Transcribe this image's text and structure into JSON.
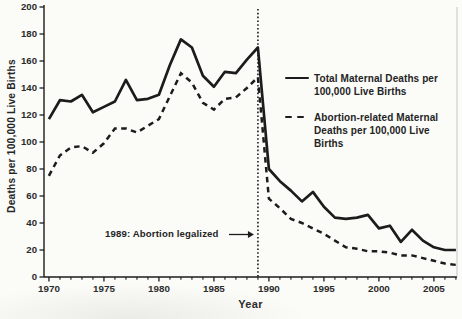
{
  "page": {
    "background": "#fbfbf8",
    "ink_color": "#1c1c1c"
  },
  "chart_data": {
    "type": "line",
    "title": "",
    "xlabel": "Year",
    "ylabel": "Deaths per 100,000 Live Births",
    "xlim": [
      1969.55,
      2007.1
    ],
    "ylim": [
      0,
      200
    ],
    "grid": false,
    "legend_position": "inside-upper-right",
    "y_ticks": [
      0,
      20,
      40,
      60,
      80,
      100,
      120,
      140,
      160,
      180,
      200
    ],
    "x_major_ticks": [
      1970,
      1975,
      1980,
      1985,
      1990,
      1995,
      2000,
      2005
    ],
    "x_minor_tick_every": 1,
    "x": [
      1970,
      1971,
      1972,
      1973,
      1974,
      1975,
      1976,
      1977,
      1978,
      1979,
      1980,
      1981,
      1982,
      1983,
      1984,
      1985,
      1986,
      1987,
      1988,
      1989,
      1990,
      1991,
      1992,
      1993,
      1994,
      1995,
      1996,
      1997,
      1998,
      1999,
      2000,
      2001,
      2002,
      2003,
      2004,
      2005,
      2006,
      2007
    ],
    "series": [
      {
        "name": "Total Maternal Deaths per 100,000 Live Births",
        "style": "solid",
        "values": [
          117,
          131,
          130,
          135,
          122,
          126,
          130,
          146,
          131,
          132,
          135,
          157,
          176,
          170,
          149,
          141,
          152,
          151,
          161,
          170,
          80,
          71,
          64,
          56,
          63,
          52,
          44,
          43,
          44,
          46,
          36,
          38,
          26,
          35,
          27,
          22,
          20,
          20
        ]
      },
      {
        "name": "Abortion-related Maternal Deaths per 100,000 Live Births",
        "style": "dashed",
        "values": [
          75,
          90,
          96,
          97,
          92,
          99,
          110,
          110,
          107,
          112,
          117,
          134,
          151,
          144,
          129,
          124,
          132,
          133,
          140,
          148,
          58,
          51,
          43,
          40,
          36,
          32,
          27,
          22,
          21,
          19,
          19,
          18,
          16,
          16,
          14,
          12,
          10,
          9
        ]
      }
    ],
    "vline": {
      "year": 1989,
      "style": "dotted"
    },
    "annotation": {
      "text": "1989: Abortion legalized",
      "arrow_points_to_year": 1989
    }
  }
}
